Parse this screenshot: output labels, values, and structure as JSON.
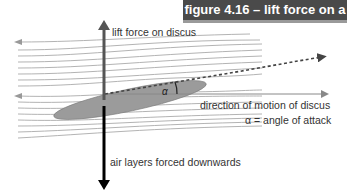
{
  "figure": {
    "title": "figure 4.16 – lift force on a discus"
  },
  "labels": {
    "lift": "lift force on discus",
    "direction": "direction of motion of discus",
    "alpha_def": "α = angle of attack",
    "alpha_symbol": "α",
    "downwash": "air layers forced downwards"
  },
  "colors": {
    "header_bg": "#4a4a4a",
    "header_border": "#9a9a9a",
    "discus_fill": "#9b9b9b",
    "lift_arrow": "#555555",
    "down_arrow": "#000000",
    "flow_lines": "#9a9a9a"
  }
}
